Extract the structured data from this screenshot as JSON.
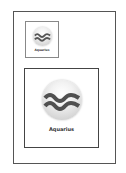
{
  "icon_preview": {
    "small": {
      "label": "Aquarius",
      "icon": "aquarius-icon"
    },
    "large": {
      "label": "Aquarius",
      "icon": "aquarius-icon"
    }
  },
  "colors": {
    "wave": "#555555",
    "frame": "#555555"
  }
}
